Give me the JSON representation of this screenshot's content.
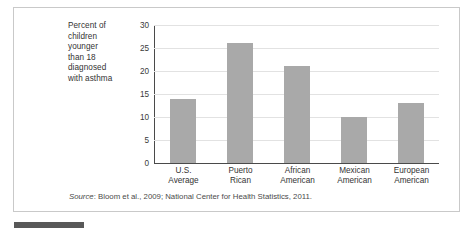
{
  "figure": {
    "axis_caption_lines": [
      "Percent of",
      "children",
      "younger",
      "than 18",
      "diagnosed",
      "with asthma"
    ],
    "source_prefix": "Source",
    "source_text": ": Bloom et al., 2009; National Center for Health Statistics, 2011."
  },
  "colors": {
    "bar_fill": "#a9a9a9",
    "gridline": "#e2e2e2",
    "axis": "#4a4a4a",
    "frame_border": "#c9c9c9",
    "text": "#333333",
    "swatch": "#585858"
  },
  "chart_data": {
    "type": "bar",
    "title": "",
    "subtitle": "",
    "xlabel": "",
    "ylabel": "Percent of children younger than 18 diagnosed with asthma",
    "categories": [
      "U.S. Average",
      "Puerto Rican",
      "African American",
      "Mexican American",
      "European American"
    ],
    "category_lines": [
      [
        "U.S.",
        "Average"
      ],
      [
        "Puerto",
        "Rican"
      ],
      [
        "African",
        "American"
      ],
      [
        "Mexican",
        "American"
      ],
      [
        "European",
        "American"
      ]
    ],
    "values": [
      14,
      26,
      21,
      10,
      13
    ],
    "ylim": [
      0,
      30
    ],
    "yticks": [
      0,
      5,
      10,
      15,
      20,
      25,
      30
    ],
    "ytick_labels": [
      "0",
      "5",
      "10",
      "15",
      "20",
      "25",
      "30"
    ],
    "grid": true,
    "legend": false,
    "source": "Source: Bloom et al., 2009; National Center for Health Statistics, 2011."
  }
}
